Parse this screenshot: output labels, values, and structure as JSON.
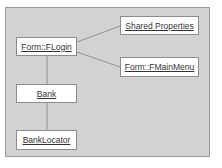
{
  "diagram": {
    "type": "object-collaboration",
    "colors": {
      "background": "#d3d3d3",
      "node_fill": "#ffffff",
      "node_border": "#8c8c8c",
      "edge": "#808080"
    },
    "nodes": [
      {
        "id": "flogin",
        "label": "Form::FLogin"
      },
      {
        "id": "shared",
        "label": "Shared Properties"
      },
      {
        "id": "fmainmenu",
        "label": "Form::FMainMenu"
      },
      {
        "id": "bank",
        "label": "Bank"
      },
      {
        "id": "banklocator",
        "label": "BankLocator"
      }
    ],
    "edges": [
      {
        "from": "Form::FLogin",
        "to": "Shared Properties"
      },
      {
        "from": "Form::FLogin",
        "to": "Form::FMainMenu"
      },
      {
        "from": "Form::FLogin",
        "to": "Bank"
      },
      {
        "from": "Bank",
        "to": "BankLocator"
      }
    ]
  }
}
